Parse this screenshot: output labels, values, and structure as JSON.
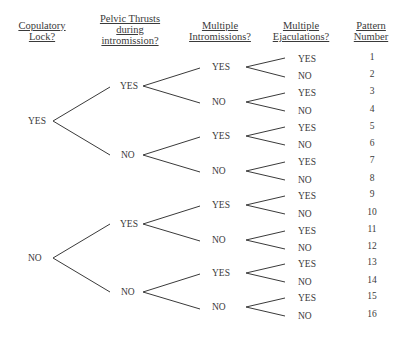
{
  "headers": {
    "h1": [
      "Copulatory",
      "Lock?"
    ],
    "h2": [
      "Pelvic Thrusts",
      "during",
      "intromission?"
    ],
    "h3": [
      "Multiple",
      "Intromissions?"
    ],
    "h4": [
      "Multiple",
      "Ejaculations?"
    ],
    "h5": [
      "Pattern",
      "Number"
    ]
  },
  "level1": [
    "YES",
    "NO"
  ],
  "level2": [
    "YES",
    "NO",
    "YES",
    "NO"
  ],
  "level3": [
    "YES",
    "NO",
    "YES",
    "NO",
    "YES",
    "NO",
    "YES",
    "NO"
  ],
  "level4": [
    "YES",
    "NO",
    "YES",
    "NO",
    "YES",
    "NO",
    "YES",
    "NO",
    "YES",
    "NO",
    "YES",
    "NO",
    "YES",
    "NO",
    "YES",
    "NO"
  ],
  "patterns": [
    "1",
    "2",
    "3",
    "4",
    "5",
    "6",
    "7",
    "8",
    "9",
    "10",
    "11",
    "12",
    "13",
    "14",
    "15",
    "16"
  ],
  "colors": {
    "line": "#3a3a3a",
    "text": "#3a3a3a",
    "background": "#ffffff"
  }
}
